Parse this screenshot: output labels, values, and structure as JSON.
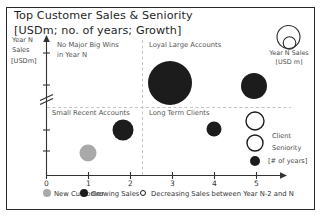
{
  "title": "Top Customer Sales & Seniority",
  "subtitle": "[USDm; no. of years; Growth]",
  "colors": {
    "bubble_black": "#1c1c1c",
    "bubble_gray": "#a9a9a9",
    "dashed_line": "#c4c4c4",
    "axis": "#333333",
    "frame_border": "#2b2b2b"
  },
  "y_axis": {
    "label_line1": "Year N",
    "label_line2": "Sales",
    "label_line3": "[USDm]",
    "scale_labeled": false,
    "has_break": true
  },
  "x_axis": {
    "label_line1": "Client",
    "label_line2": "Seniority",
    "label_line3": "[# of years]",
    "range": [
      0,
      5
    ]
  },
  "size_legend": {
    "line1": "Year N Sales",
    "line2": "[USD m]"
  },
  "quadrants": {
    "top_left_line1": "No Major Big Wins",
    "top_left_line2": "in Year N",
    "top_right": "Loyal Large Accounts",
    "bottom_left": "Small Recent Accounts",
    "bottom_right": "Long Term Clients"
  },
  "legend": {
    "items": [
      {
        "label": "New Customer",
        "type": "new",
        "swatch": "gray-filled-circle"
      },
      {
        "label": "Growing Sales",
        "type": "growing",
        "swatch": "black-filled-circle"
      },
      {
        "label": "Decreasing Sales between Year N-2 and N",
        "type": "decreasing",
        "swatch": "open-circle"
      }
    ]
  },
  "chart_data": {
    "type": "scatter",
    "subtype": "bubble",
    "title": "Top Customer Sales & Seniority",
    "xlabel": "Client Seniority [# of years]",
    "ylabel": "Year N Sales [USDm]",
    "xlim": [
      0,
      5.6
    ],
    "x_tick_labels": [
      "0",
      "1",
      "2",
      "3",
      "4",
      "5"
    ],
    "grid": "quadrant-dashed-lines",
    "quadrant_split": {
      "x_years": 2.3,
      "y_rel": 0.5
    },
    "legend_position": "bottom",
    "points": [
      {
        "seniority_years": 3.0,
        "sales_rel": 0.68,
        "size": "very-large",
        "type": "growing",
        "quadrant": "Loyal Large Accounts",
        "cx": 170,
        "cy": 83,
        "r": 22
      },
      {
        "seniority_years": 4.9,
        "sales_rel": 0.66,
        "size": "large",
        "type": "growing",
        "quadrant": "Loyal Large Accounts",
        "cx": 254,
        "cy": 86,
        "r": 13
      },
      {
        "seniority_years": 1.8,
        "sales_rel": 0.33,
        "size": "medium",
        "type": "growing",
        "quadrant": "Small Recent Accounts",
        "cx": 123,
        "cy": 130,
        "r": 10.5
      },
      {
        "seniority_years": 1.0,
        "sales_rel": 0.16,
        "size": "small",
        "type": "new",
        "quadrant": "Small Recent Accounts",
        "cx": 88,
        "cy": 153,
        "r": 8.5
      },
      {
        "seniority_years": 4.0,
        "sales_rel": 0.34,
        "size": "small",
        "type": "growing",
        "quadrant": "Long Term Clients",
        "cx": 214,
        "cy": 129,
        "r": 7.5
      },
      {
        "seniority_years": 5.0,
        "sales_rel": 0.4,
        "size": "medium",
        "type": "decreasing",
        "quadrant": "Long Term Clients",
        "cx": 255,
        "cy": 121,
        "r": 9
      },
      {
        "seniority_years": 5.0,
        "sales_rel": 0.24,
        "size": "small",
        "type": "decreasing",
        "quadrant": "Long Term Clients",
        "cx": 255,
        "cy": 143,
        "r": 8
      },
      {
        "seniority_years": 5.0,
        "sales_rel": 0.1,
        "size": "very-small",
        "type": "growing",
        "quadrant": "Long Term Clients",
        "cx": 255,
        "cy": 161,
        "r": 5
      }
    ]
  }
}
